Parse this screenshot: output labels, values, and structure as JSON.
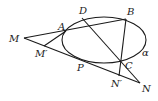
{
  "diagram": {
    "type": "geometry",
    "ellipse": {
      "name": "α",
      "cx": 104,
      "cy": 40,
      "rx": 42,
      "ry": 23
    },
    "points": [
      {
        "id": "M",
        "label": "M",
        "x": 24,
        "y": 38,
        "lx": 9,
        "ly": 42
      },
      {
        "id": "A",
        "label": "A",
        "x": 66,
        "y": 31,
        "lx": 58,
        "ly": 30
      },
      {
        "id": "D",
        "label": "D",
        "x": 82,
        "y": 18,
        "lx": 79,
        "ly": 14
      },
      {
        "id": "B",
        "label": "B",
        "x": 126,
        "y": 19,
        "lx": 127,
        "ly": 15
      },
      {
        "id": "Mp",
        "label": "M′",
        "x": 44,
        "y": 46,
        "lx": 35,
        "ly": 57
      },
      {
        "id": "P",
        "label": "P",
        "x": 90,
        "y": 62,
        "lx": 77,
        "ly": 71
      },
      {
        "id": "C",
        "label": "C",
        "x": 121,
        "y": 62,
        "lx": 125,
        "ly": 69
      },
      {
        "id": "Np",
        "label": "N′",
        "x": 119,
        "y": 76,
        "lx": 111,
        "ly": 87
      },
      {
        "id": "N",
        "label": "N",
        "x": 140,
        "y": 83,
        "lx": 142,
        "ly": 92
      }
    ],
    "alpha_label": {
      "text": "α",
      "x": 142,
      "y": 56
    },
    "segments": [
      {
        "from": "M",
        "to": "B"
      },
      {
        "from": "M",
        "to": "N"
      },
      {
        "from": "A",
        "to": "Mp"
      },
      {
        "from": "D",
        "to": "N"
      },
      {
        "from": "B",
        "to": "Np"
      }
    ]
  }
}
